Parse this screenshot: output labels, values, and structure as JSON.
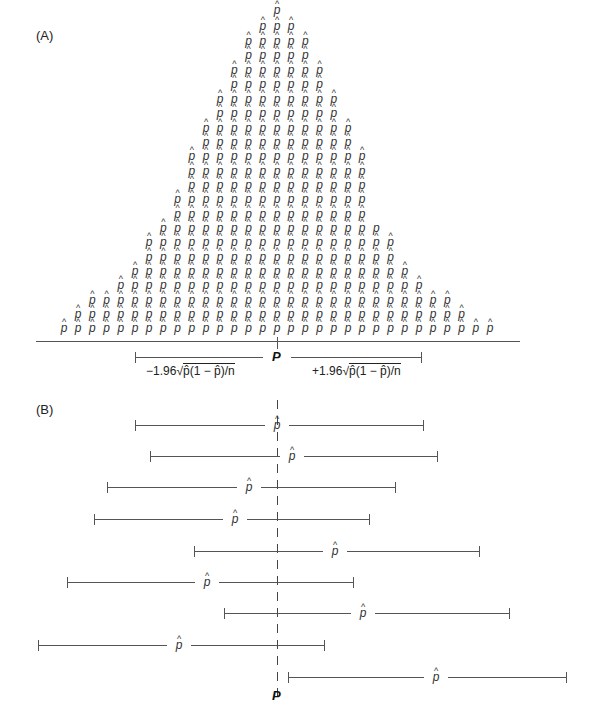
{
  "panels": {
    "a_label": "(A)",
    "b_label": "(B)"
  },
  "symbols": {
    "p_hat": "p",
    "hat": "^",
    "p_plain": "p",
    "P": "P"
  },
  "panel_a": {
    "origin_x": 64,
    "step_x": 14.2,
    "rows": [
      {
        "y": 10,
        "from": 15,
        "to": 15
      },
      {
        "y": 26,
        "from": 14,
        "to": 16
      },
      {
        "y": 41,
        "from": 13,
        "to": 17
      },
      {
        "y": 55,
        "from": 13,
        "to": 17
      },
      {
        "y": 70,
        "from": 12,
        "to": 18
      },
      {
        "y": 84,
        "from": 12,
        "to": 18
      },
      {
        "y": 99,
        "from": 11,
        "to": 19
      },
      {
        "y": 113,
        "from": 11,
        "to": 19
      },
      {
        "y": 128,
        "from": 10,
        "to": 20
      },
      {
        "y": 142,
        "from": 10,
        "to": 20
      },
      {
        "y": 156,
        "from": 9,
        "to": 21
      },
      {
        "y": 171,
        "from": 9,
        "to": 21
      },
      {
        "y": 185,
        "from": 9,
        "to": 21
      },
      {
        "y": 199,
        "from": 8,
        "to": 21
      },
      {
        "y": 214,
        "from": 8,
        "to": 21
      },
      {
        "y": 228,
        "from": 7,
        "to": 22,
        "last_plain": true
      },
      {
        "y": 242,
        "from": 6,
        "to": 23
      },
      {
        "y": 257,
        "from": 6,
        "to": 23
      },
      {
        "y": 271,
        "from": 5,
        "to": 24
      },
      {
        "y": 285,
        "from": 4,
        "to": 25
      },
      {
        "y": 300,
        "from": 2,
        "to": 27
      },
      {
        "y": 314,
        "from": 1,
        "to": 28
      },
      {
        "y": 328,
        "from": 0,
        "to": 30
      }
    ],
    "axis": {
      "y": 341,
      "x1": 36,
      "x2": 520
    },
    "p_tick_x": 277,
    "interval": {
      "y": 357,
      "x1": 135,
      "x2": 421
    },
    "formula_left": {
      "sign": "−1.96",
      "radicand": "p̂(1 − p̂)/n"
    },
    "formula_right": {
      "sign": "+1.96",
      "radicand": "p̂(1 − p̂)/n"
    }
  },
  "panel_b": {
    "true_p_x": 277,
    "dash_top": 400,
    "dash_bottom": 690,
    "intervals": [
      {
        "y": 425,
        "x1": 135,
        "x2": 423,
        "phat_x": 277
      },
      {
        "y": 456,
        "x1": 150,
        "x2": 437,
        "phat_x": 292
      },
      {
        "y": 487,
        "x1": 107,
        "x2": 395,
        "phat_x": 249
      },
      {
        "y": 519,
        "x1": 94,
        "x2": 369,
        "phat_x": 235
      },
      {
        "y": 551,
        "x1": 194,
        "x2": 479,
        "phat_x": 335
      },
      {
        "y": 582,
        "x1": 67,
        "x2": 353,
        "phat_x": 207
      },
      {
        "y": 613,
        "x1": 224,
        "x2": 509,
        "phat_x": 363
      },
      {
        "y": 645,
        "x1": 38,
        "x2": 324,
        "phat_x": 179
      },
      {
        "y": 677,
        "x1": 288,
        "x2": 566,
        "phat_x": 436
      }
    ],
    "P_label_y": 696
  }
}
